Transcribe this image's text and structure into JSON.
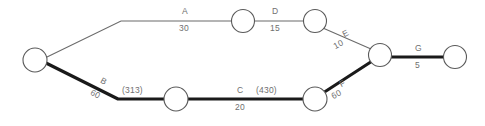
{
  "diagram": {
    "type": "network-graph",
    "title": "",
    "nodes": [
      {
        "id": "n1",
        "label": "",
        "cx": 35,
        "cy": 60,
        "r": 12
      },
      {
        "id": "n2",
        "label": "",
        "cx": 243,
        "cy": 21,
        "r": 11.5
      },
      {
        "id": "n3",
        "label": "",
        "cx": 315,
        "cy": 21,
        "r": 11.5
      },
      {
        "id": "n4",
        "label": "",
        "cx": 380,
        "cy": 55,
        "r": 11.5
      },
      {
        "id": "n5",
        "label": "",
        "cx": 455,
        "cy": 57,
        "r": 11.5
      },
      {
        "id": "n6",
        "label": "",
        "cx": 176,
        "cy": 99,
        "r": 12
      },
      {
        "id": "n7",
        "label": "",
        "cx": 315,
        "cy": 99,
        "r": 12
      }
    ],
    "edges": [
      {
        "id": "A",
        "name": "A",
        "value": "30",
        "flow": "",
        "weight": "thin",
        "from": "n1",
        "to": "n2"
      },
      {
        "id": "D",
        "name": "D",
        "value": "15",
        "flow": "",
        "weight": "thin",
        "from": "n2",
        "to": "n3"
      },
      {
        "id": "E",
        "name": "E",
        "value": "10",
        "flow": "",
        "weight": "thin",
        "from": "n3",
        "to": "n4"
      },
      {
        "id": "G",
        "name": "G",
        "value": "5",
        "flow": "",
        "weight": "thick",
        "from": "n4",
        "to": "n5"
      },
      {
        "id": "B",
        "name": "B",
        "value": "60",
        "flow": "(313)",
        "weight": "thick",
        "from": "n1",
        "to": "n6"
      },
      {
        "id": "C",
        "name": "C",
        "value": "20",
        "flow": "(430)",
        "weight": "thick",
        "from": "n6",
        "to": "n7"
      },
      {
        "id": "F",
        "name": "F",
        "value": "60",
        "flow": "",
        "weight": "thick",
        "from": "n7",
        "to": "n4"
      }
    ],
    "labels": {
      "a_name": "A",
      "a_value": "30",
      "d_name": "D",
      "d_value": "15",
      "e_name": "E",
      "e_value": "10",
      "g_name": "G",
      "g_value": "5",
      "b_name": "B",
      "b_value": "60",
      "b_flow": "(313)",
      "c_name": "C",
      "c_value": "20",
      "c_flow": "(430)",
      "f_name": "F",
      "f_value": "60"
    },
    "colors": {
      "background": "#ffffff",
      "thin_edge": "#6b6b6b",
      "thick_edge": "#1a1a1a",
      "node_stroke": "#5a5a5a",
      "node_fill": "#ffffff",
      "text": "#6f6f6f"
    }
  }
}
